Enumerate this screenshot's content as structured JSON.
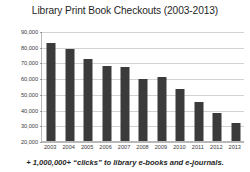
{
  "chart_data": {
    "type": "bar",
    "title": "Library Print Book Checkouts (2003-2013)",
    "xlabel": "",
    "ylabel": "",
    "categories": [
      "2003",
      "2004",
      "2005",
      "2006",
      "2007",
      "2008",
      "2009",
      "2010",
      "2011",
      "2012",
      "2013"
    ],
    "values": [
      82500,
      78500,
      72000,
      67500,
      66800,
      59500,
      60800,
      52800,
      45000,
      38000,
      31500
    ],
    "ylim": [
      20000,
      90000
    ],
    "ytick_values": [
      20000,
      30000,
      40000,
      50000,
      60000,
      70000,
      80000,
      90000
    ],
    "ytick_labels": [
      "20,000",
      "30,000",
      "40,000",
      "50,000",
      "60,000",
      "70,000",
      "80,000",
      "90,000"
    ],
    "grid": true,
    "legend": null,
    "bar_color": "#3b3b3b",
    "grid_color": "#d2d2d2",
    "axis_color": "#b9b9b9",
    "background": "#ffffff"
  },
  "footnote": {
    "text": "+ 1,000,000+ “clicks” to library e-books and e-journals."
  }
}
